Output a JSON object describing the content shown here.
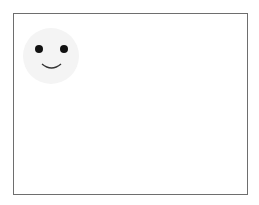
{
  "canvas": {
    "border_color": "#6e6e6e",
    "background": "#ffffff"
  },
  "icon": {
    "name": "smiley-face-icon",
    "face_color": "#f4f4f4",
    "feature_color": "#111111"
  }
}
